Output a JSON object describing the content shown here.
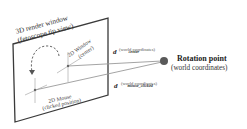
{
  "diagram": {
    "render_window": {
      "title_line1": "3D render window",
      "title_line2": "(fetoscope tip view)"
    },
    "window_center": {
      "line1": "2D Window",
      "line2": "(center)"
    },
    "mouse_point": {
      "line1": "2D Mouse",
      "line2": "(clicked position)"
    },
    "d_center": {
      "symbol": "d",
      "subscript": "center",
      "note": "(world coordinates)"
    },
    "d_mouse": {
      "symbol": "d",
      "subscript": "mouse_clicked",
      "note": "(world coordinates)"
    },
    "rotation_point": {
      "title": "Rotation point",
      "subtitle": "(world coordinates)"
    },
    "colors": {
      "frame": "#3a3a3a",
      "rays": "#9a9a9a",
      "crosshair": "#b8b8b8",
      "rotation_point": "#555555",
      "arc": "#555555"
    }
  }
}
